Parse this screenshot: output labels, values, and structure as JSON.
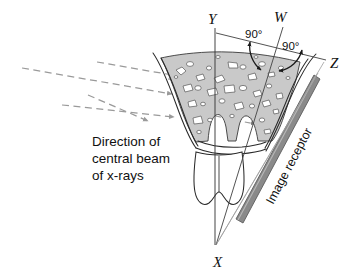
{
  "figure": {
    "labels": {
      "y": "Y",
      "w": "W",
      "z": "Z",
      "x": "X",
      "angle_left": "90°",
      "angle_right": "90°"
    },
    "beam_caption": {
      "line1": "Direction of",
      "line2": "central beam",
      "line3": "of x-rays"
    },
    "receptor_label": "Image receptor",
    "colors": {
      "ink": "#111111",
      "outline": "#2a2a2a",
      "bone_fill": "#c9c9c9",
      "bone_space": "#ffffff",
      "receptor_fill": "#8a8a8a",
      "receptor_edge": "#5c5c5c",
      "beam_dash": "#9a9a9a",
      "background": "#ffffff"
    },
    "geometry": {
      "vertex_x": [
        215,
        245
      ],
      "apex_label_x": [
        219,
        262
      ],
      "bisector_vertex": [
        274,
        74
      ],
      "beam_arrow_count": 4
    }
  }
}
